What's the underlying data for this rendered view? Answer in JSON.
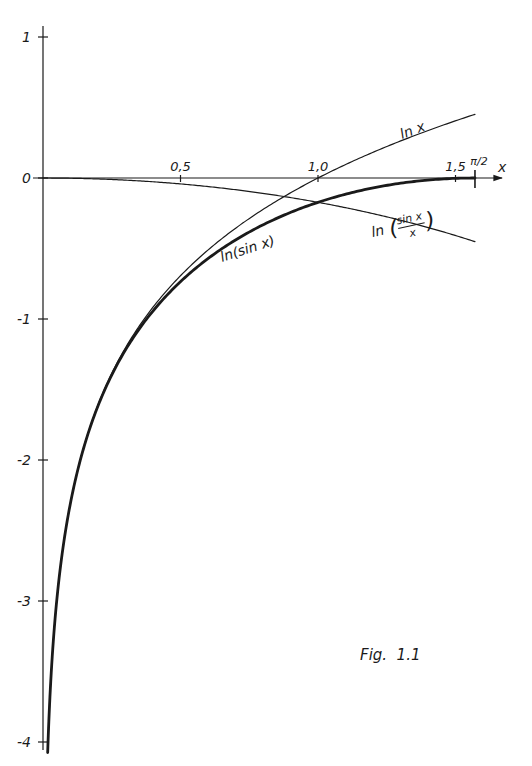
{
  "figure": {
    "caption": "Fig.  1.1"
  },
  "chart_data": {
    "type": "line",
    "title": "",
    "caption": "Fig. 1.1",
    "xlabel": "x",
    "ylabel": "",
    "xlim": [
      0,
      1.65
    ],
    "ylim": [
      -4.1,
      1.05
    ],
    "grid": false,
    "legend": "inline curve labels",
    "x_ticks": [
      {
        "value": 0.5,
        "label": "0,5"
      },
      {
        "value": 1.0,
        "label": "1,0"
      },
      {
        "value": 1.5,
        "label": "1,5"
      },
      {
        "value": 1.5708,
        "label": "π/2"
      }
    ],
    "y_ticks": [
      {
        "value": 1,
        "label": "1"
      },
      {
        "value": 0,
        "label": "0"
      },
      {
        "value": -1,
        "label": "-1"
      },
      {
        "value": -2,
        "label": "-2"
      },
      {
        "value": -3,
        "label": "-3"
      },
      {
        "value": -4,
        "label": "-4"
      }
    ],
    "series": [
      {
        "name": "ln x",
        "label": "ln x",
        "style": "thin",
        "x": [
          0.017,
          0.05,
          0.1,
          0.2,
          0.3,
          0.4,
          0.5,
          0.6,
          0.7,
          0.8,
          0.9,
          1.0,
          1.1,
          1.2,
          1.3,
          1.4,
          1.5,
          1.5708
        ],
        "y": [
          -4.07,
          -3.0,
          -2.3,
          -1.61,
          -1.2,
          -0.92,
          -0.69,
          -0.51,
          -0.36,
          -0.22,
          -0.11,
          0.0,
          0.1,
          0.18,
          0.26,
          0.34,
          0.41,
          0.45
        ]
      },
      {
        "name": "ln(sin x)",
        "label": "ln(sin x)",
        "style": "bold",
        "x": [
          0.017,
          0.05,
          0.1,
          0.2,
          0.3,
          0.4,
          0.5,
          0.6,
          0.7,
          0.8,
          0.9,
          1.0,
          1.1,
          1.2,
          1.3,
          1.4,
          1.5,
          1.5708
        ],
        "y": [
          -4.07,
          -3.0,
          -2.3,
          -1.62,
          -1.22,
          -0.94,
          -0.73,
          -0.57,
          -0.44,
          -0.33,
          -0.24,
          -0.17,
          -0.11,
          -0.07,
          -0.04,
          -0.01,
          -0.003,
          0.0
        ]
      },
      {
        "name": "ln(sin x / x)",
        "label": "ln(sin x / x)",
        "style": "thin",
        "x": [
          0.0,
          0.1,
          0.2,
          0.3,
          0.4,
          0.5,
          0.6,
          0.7,
          0.8,
          0.9,
          1.0,
          1.1,
          1.2,
          1.3,
          1.4,
          1.5,
          1.5708
        ],
        "y": [
          0.0,
          -0.002,
          -0.007,
          -0.015,
          -0.027,
          -0.042,
          -0.061,
          -0.083,
          -0.109,
          -0.139,
          -0.172,
          -0.209,
          -0.251,
          -0.297,
          -0.348,
          -0.404,
          -0.452
        ]
      }
    ]
  }
}
